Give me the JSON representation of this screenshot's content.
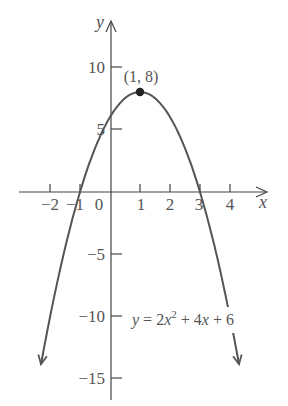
{
  "chart_data": {
    "type": "line",
    "title": "",
    "xlabel": "x",
    "ylabel": "y",
    "xlim": [
      -2.5,
      5.2
    ],
    "ylim": [
      -16.5,
      13.5
    ],
    "x_ticks": [
      -2,
      -1,
      1,
      2,
      3,
      4
    ],
    "x_tick_labels": [
      "−2",
      "−1",
      "1",
      "2",
      "3",
      "4"
    ],
    "origin_label": "0",
    "y_ticks": [
      10,
      5,
      -5,
      -10,
      -15
    ],
    "y_tick_labels": [
      "10",
      "5",
      "−5",
      "−10",
      "−15"
    ],
    "grid": false,
    "legend": null,
    "series": [
      {
        "name": "y = 2x^2 + 4x + 6",
        "function": "-2x^2 + 4x + 6",
        "coefficients": {
          "a": -2,
          "b": 4,
          "c": 6
        },
        "x_range": [
          -2.3,
          4.3
        ],
        "sample_points": [
          {
            "x": -2,
            "y": -10
          },
          {
            "x": -1,
            "y": 0
          },
          {
            "x": 0,
            "y": 6
          },
          {
            "x": 1,
            "y": 8
          },
          {
            "x": 2,
            "y": 6
          },
          {
            "x": 3,
            "y": 0
          },
          {
            "x": 4,
            "y": -10
          }
        ],
        "arrows_at_ends": true
      }
    ],
    "annotations": [
      {
        "text": "(1, 8)",
        "x": 1,
        "y": 8,
        "marker": "filled-circle"
      },
      {
        "text": "y = 2x² + 4x + 6",
        "position": "right of y-axis near y=-10"
      }
    ]
  },
  "labels": {
    "y_axis": "y",
    "x_axis": "x",
    "origin": "0",
    "vertex": "(1, 8)",
    "equation_prefix": "y = 2",
    "equation_var": "x",
    "equation_exp": "2",
    "equation_rest": " + 4",
    "equation_var2": "x",
    "equation_end": " + 6",
    "x_ticks": [
      "−2",
      "−1",
      "1",
      "2",
      "3",
      "4"
    ],
    "y_ticks": [
      "10",
      "5",
      "−5",
      "−10",
      "−15"
    ]
  },
  "colors": {
    "axis": "#444444",
    "curve": "#555555",
    "text": "#555555",
    "point": "#222222"
  }
}
